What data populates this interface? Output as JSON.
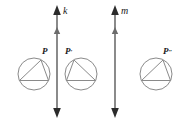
{
  "figure": {
    "type": "geometry-reflection-diagram",
    "width": 183,
    "height": 124,
    "background": "#ffffff",
    "stroke_dark": "#2b2b2b",
    "stroke_gray": "#8a8a8a",
    "label_color": "#1a1a1a"
  },
  "lines": [
    {
      "id": "k",
      "label": "k",
      "orientation": "vertical",
      "x": 57,
      "y_top": 6,
      "y_bottom": 116,
      "double_headed": true,
      "mid_arrow_y": 30,
      "label_x": 63,
      "label_y": 13
    },
    {
      "id": "m",
      "label": "m",
      "orientation": "vertical",
      "x": 115,
      "y_top": 6,
      "y_bottom": 116,
      "double_headed": true,
      "mid_arrow_y": 30,
      "label_x": 121,
      "label_y": 13
    }
  ],
  "shapes": [
    {
      "id": "shape-p",
      "label": "P",
      "prime": "",
      "cx": 34,
      "cy": 74,
      "r": 16,
      "orientation": "apex-right",
      "label_x": 45,
      "label_y": 53
    },
    {
      "id": "shape-p-prime",
      "label": "P",
      "prime": "′",
      "cx": 81,
      "cy": 74,
      "r": 16,
      "orientation": "apex-left",
      "label_x": 67,
      "label_y": 53
    },
    {
      "id": "shape-p-double-prime",
      "label": "P",
      "prime": "″",
      "cx": 156,
      "cy": 74,
      "r": 16,
      "orientation": "apex-right",
      "label_x": 166,
      "label_y": 53
    }
  ]
}
